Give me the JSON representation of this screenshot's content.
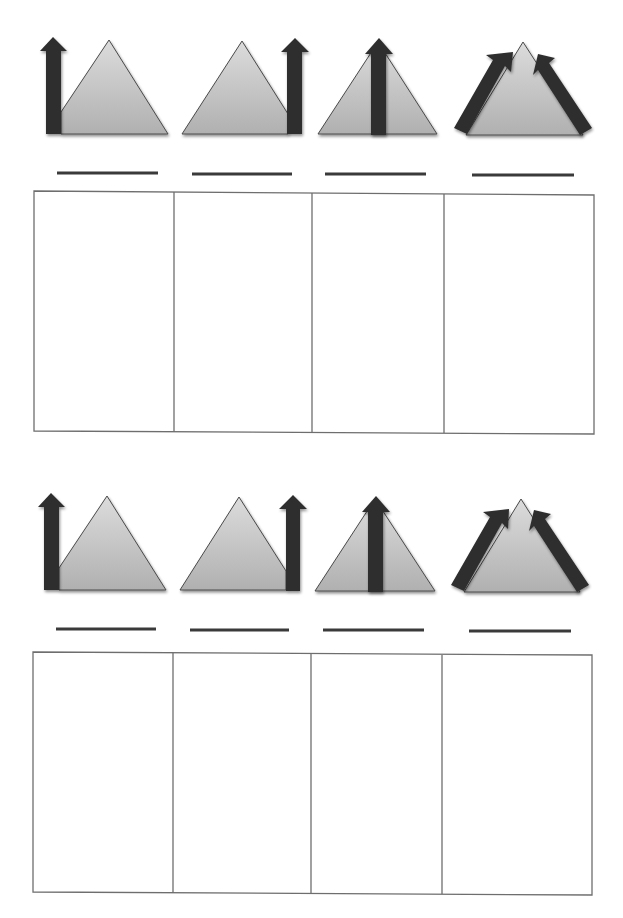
{
  "worksheet": {
    "title_fragment": "",
    "colors": {
      "triangle_fill_top": "#d9d9d9",
      "triangle_fill_bottom": "#b3b3b3",
      "triangle_stroke": "#4a4a4a",
      "arrow_fill": "#2e2e2e",
      "answer_line": "#3a3a3a",
      "box_stroke": "#6e6e6e"
    },
    "sections": [
      {
        "id": "upper",
        "diagrams": [
          {
            "type": "arrow-left-side",
            "answer_blank": ""
          },
          {
            "type": "arrow-right-side",
            "answer_blank": ""
          },
          {
            "type": "arrow-center",
            "answer_blank": ""
          },
          {
            "type": "arrows-both-slopes",
            "answer_blank": ""
          }
        ],
        "answer_boxes": [
          "",
          "",
          "",
          ""
        ]
      },
      {
        "id": "lower",
        "diagrams": [
          {
            "type": "arrow-left-side",
            "answer_blank": ""
          },
          {
            "type": "arrow-right-side",
            "answer_blank": ""
          },
          {
            "type": "arrow-center",
            "answer_blank": ""
          },
          {
            "type": "arrows-both-slopes",
            "answer_blank": ""
          }
        ],
        "answer_boxes": [
          "",
          "",
          "",
          ""
        ]
      }
    ]
  }
}
